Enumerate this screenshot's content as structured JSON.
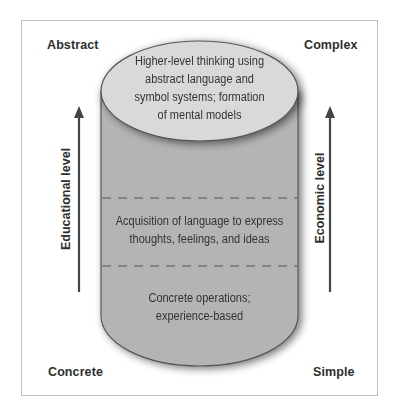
{
  "corners": {
    "top_left": "Abstract",
    "top_right": "Complex",
    "bottom_left": "Concrete",
    "bottom_right": "Simple"
  },
  "axes": {
    "left": {
      "label": "Educational level",
      "direction": "up"
    },
    "right": {
      "label": "Economic level",
      "direction": "up"
    }
  },
  "cylinder": {
    "levels": [
      {
        "position": "top",
        "lines": [
          "Higher-level thinking using",
          "abstract language and",
          "symbol systems; formation",
          "of mental models"
        ]
      },
      {
        "position": "middle",
        "lines": [
          "Acquisition of language to express",
          "thoughts, feelings, and ideas"
        ]
      },
      {
        "position": "bottom",
        "lines": [
          "Concrete operations;",
          "experience-based"
        ]
      }
    ]
  },
  "colors": {
    "cylinder_body": "#b4b4b4",
    "cylinder_top": "#d9d9d9",
    "outline": "#555555",
    "arrow": "#444444"
  }
}
